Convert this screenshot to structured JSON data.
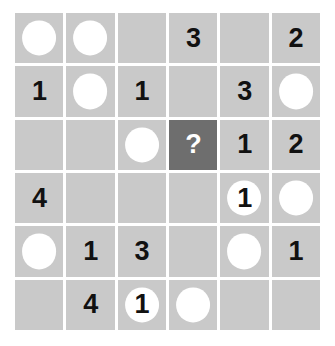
{
  "puzzle": {
    "title": "Number and Circle Grid Puzzle",
    "rows": 6,
    "columns": 6,
    "colors": {
      "page_background": "#ffffff",
      "cell_fill": "#c9c9c9",
      "grid_line": "#ffffff",
      "highlight_cell_fill": "#6e6e6e",
      "disc_fill": "#ffffff",
      "number_color": "#111111",
      "highlight_number_color": "#ffffff"
    },
    "question_marker": "?",
    "cells": [
      [
        {
          "id": "r1c1",
          "value": "",
          "disc": true,
          "highlight": false
        },
        {
          "id": "r1c2",
          "value": "",
          "disc": true,
          "highlight": false
        },
        {
          "id": "r1c3",
          "value": "",
          "disc": false,
          "highlight": false
        },
        {
          "id": "r1c4",
          "value": "3",
          "disc": false,
          "highlight": false
        },
        {
          "id": "r1c5",
          "value": "",
          "disc": false,
          "highlight": false
        },
        {
          "id": "r1c6",
          "value": "2",
          "disc": false,
          "highlight": false
        }
      ],
      [
        {
          "id": "r2c1",
          "value": "1",
          "disc": false,
          "highlight": false
        },
        {
          "id": "r2c2",
          "value": "",
          "disc": true,
          "highlight": false
        },
        {
          "id": "r2c3",
          "value": "1",
          "disc": false,
          "highlight": false
        },
        {
          "id": "r2c4",
          "value": "",
          "disc": false,
          "highlight": false
        },
        {
          "id": "r2c5",
          "value": "3",
          "disc": false,
          "highlight": false
        },
        {
          "id": "r2c6",
          "value": "",
          "disc": true,
          "highlight": false
        }
      ],
      [
        {
          "id": "r3c1",
          "value": "",
          "disc": false,
          "highlight": false
        },
        {
          "id": "r3c2",
          "value": "",
          "disc": false,
          "highlight": false
        },
        {
          "id": "r3c3",
          "value": "",
          "disc": true,
          "highlight": false
        },
        {
          "id": "r3c4",
          "value": "?",
          "disc": false,
          "highlight": true
        },
        {
          "id": "r3c5",
          "value": "1",
          "disc": false,
          "highlight": false
        },
        {
          "id": "r3c6",
          "value": "2",
          "disc": false,
          "highlight": false
        }
      ],
      [
        {
          "id": "r4c1",
          "value": "4",
          "disc": false,
          "highlight": false
        },
        {
          "id": "r4c2",
          "value": "",
          "disc": false,
          "highlight": false
        },
        {
          "id": "r4c3",
          "value": "",
          "disc": false,
          "highlight": false
        },
        {
          "id": "r4c4",
          "value": "",
          "disc": false,
          "highlight": false
        },
        {
          "id": "r4c5",
          "value": "1",
          "disc": true,
          "highlight": false
        },
        {
          "id": "r4c6",
          "value": "",
          "disc": true,
          "highlight": false
        }
      ],
      [
        {
          "id": "r5c1",
          "value": "",
          "disc": true,
          "highlight": false
        },
        {
          "id": "r5c2",
          "value": "1",
          "disc": false,
          "highlight": false
        },
        {
          "id": "r5c3",
          "value": "3",
          "disc": false,
          "highlight": false
        },
        {
          "id": "r5c4",
          "value": "",
          "disc": false,
          "highlight": false
        },
        {
          "id": "r5c5",
          "value": "",
          "disc": true,
          "highlight": false
        },
        {
          "id": "r5c6",
          "value": "1",
          "disc": false,
          "highlight": false
        }
      ],
      [
        {
          "id": "r6c1",
          "value": "",
          "disc": false,
          "highlight": false
        },
        {
          "id": "r6c2",
          "value": "4",
          "disc": false,
          "highlight": false
        },
        {
          "id": "r6c3",
          "value": "1",
          "disc": true,
          "highlight": false
        },
        {
          "id": "r6c4",
          "value": "",
          "disc": true,
          "highlight": false
        },
        {
          "id": "r6c5",
          "value": "",
          "disc": false,
          "highlight": false
        },
        {
          "id": "r6c6",
          "value": "",
          "disc": false,
          "highlight": false
        }
      ]
    ]
  }
}
